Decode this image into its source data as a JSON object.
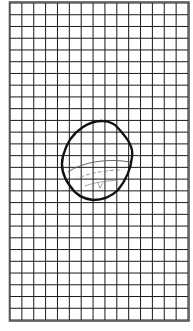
{
  "figure": {
    "type": "grid-drawing",
    "background": "#ffffff",
    "grid": {
      "columns": 15,
      "rows": 27,
      "x0": 10,
      "y0": 3,
      "x1": 188,
      "y1": 320,
      "line_color": "#1a1a1a",
      "border_color": "#444444"
    },
    "shape": {
      "description": "closed rounded blob outline with inner curved arcs",
      "stroke": "#111111",
      "inner_stroke": "#555555"
    }
  }
}
